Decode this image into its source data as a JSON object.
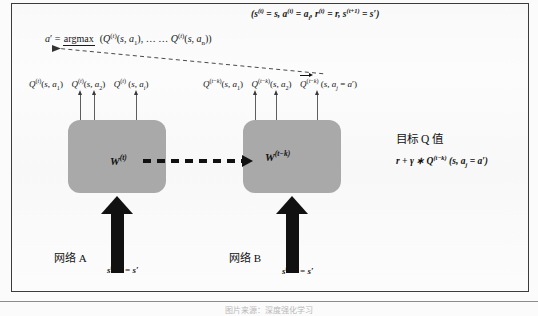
{
  "diagram": {
    "title_caption": "图片来源：深度强化学习",
    "tuple_expression": "(s(t) = s, a(t) = ai, r(t) = r, s(t+1) = s′)",
    "argmax": {
      "lhs": "a′ =",
      "operator": "argmax",
      "operator_subscript": "a",
      "arguments": "(Q(t)(s, a1), … … Q(t)(s, an))"
    },
    "left_network": {
      "name": "网络 A",
      "weights_label": "W(t)",
      "state_input": "s(t+1) = s′",
      "q_outputs": [
        "Q(t)(s, a1)",
        "Q(t)(s, a2)",
        "Q(t) (s, ai)"
      ]
    },
    "right_network": {
      "name": "网络 B",
      "weights_label": "W(t−k)",
      "state_input": "s(t+1) = s′",
      "q_outputs": [
        "Q(t−k)(s, a1)",
        "Q(t−k)(s, a2)",
        "Q(t−k) (s, aj = a′)"
      ]
    },
    "target_panel": {
      "title": "目标 Q 值",
      "formula": "r + γ ∗ Q(t−k) (s, aj = a′)"
    },
    "colors": {
      "network_box": "#a9a9a9",
      "frame_border": "#3b3b3b",
      "arrow": "#111111",
      "background": "#fcfcfc"
    }
  }
}
